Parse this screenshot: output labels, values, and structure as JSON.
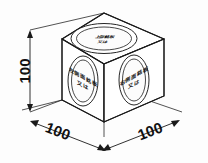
{
  "drawing": {
    "title": "Isometric cube dimension drawing",
    "line_color": "#1a1a1a",
    "background_color": "#fdfdfd",
    "dimensions": {
      "height": {
        "label": "100",
        "orientation": "vertical",
        "name": "height-dimension"
      },
      "depth_left": {
        "label": "100",
        "orientation": "isometric-left",
        "name": "depth-dimension"
      },
      "width_right": {
        "label": "100",
        "orientation": "isometric-right",
        "name": "width-dimension"
      }
    },
    "faces": {
      "top": {
        "name": "top-face",
        "label_line1": "上部銘板",
        "label_line2": "又は"
      },
      "left": {
        "name": "left-face",
        "label_line1": "左側面銘板",
        "label_line2": "又は"
      },
      "right": {
        "name": "right-face",
        "label_line1": "右側面銘板",
        "label_line2": "又は"
      }
    }
  }
}
